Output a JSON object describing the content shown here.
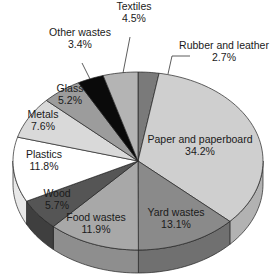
{
  "chart_data": {
    "type": "pie",
    "style": "3d-tilted",
    "title": "",
    "start_angle_deg": 0,
    "direction": "clockwise",
    "slices": [
      {
        "label": "Rubber and leather",
        "value": 2.7,
        "display": "2.7%",
        "color": "#7a7a7a",
        "side": "#5e5e5e"
      },
      {
        "label": "Paper and paperboard",
        "value": 34.2,
        "display": "34.2%",
        "color": "#cfcfcf",
        "side": "#b2b2b2"
      },
      {
        "label": "Yard wastes",
        "value": 13.1,
        "display": "13.1%",
        "color": "#8a8a8a",
        "side": "#707070"
      },
      {
        "label": "Food wastes",
        "value": 11.9,
        "display": "11.9%",
        "color": "#a8a8a8",
        "side": "#8e8e8e"
      },
      {
        "label": "Wood",
        "value": 5.7,
        "display": "5.7%",
        "color": "#555555",
        "side": "#3f3f3f"
      },
      {
        "label": "Plastics",
        "value": 11.8,
        "display": "11.8%",
        "color": "#ffffff",
        "side": "#e8e8e8"
      },
      {
        "label": "Metals",
        "value": 7.6,
        "display": "7.6%",
        "color": "#d9d9d9",
        "side": "#c2c2c2"
      },
      {
        "label": "Glass",
        "value": 5.2,
        "display": "5.2%",
        "color": "#9c9c9c",
        "side": "#828282"
      },
      {
        "label": "Other wastes",
        "value": 3.4,
        "display": "3.4%",
        "color": "#0a0a0a",
        "side": "#000000"
      },
      {
        "label": "Textiles",
        "value": 4.5,
        "display": "4.5%",
        "color": "#b4b4b4",
        "side": "#9a9a9a"
      }
    ],
    "labels": [
      {
        "name": "Rubber and leather",
        "pct": "2.7%",
        "x": 224,
        "y": 51,
        "leader": [
          [
            190,
            56
          ],
          [
            172,
            56
          ],
          [
            168,
            74
          ]
        ]
      },
      {
        "name": "Paper and paperboard",
        "pct": "34.2%",
        "x": 200,
        "y": 145
      },
      {
        "name": "Yard wastes",
        "pct": "13.1%",
        "x": 176,
        "y": 218
      },
      {
        "name": "Food wastes",
        "pct": "11.9%",
        "x": 96,
        "y": 223
      },
      {
        "name": "Wood",
        "pct": "5.7%",
        "x": 57,
        "y": 199
      },
      {
        "name": "Plastics",
        "pct": "11.8%",
        "x": 44,
        "y": 160
      },
      {
        "name": "Metals",
        "pct": "7.6%",
        "x": 43,
        "y": 120
      },
      {
        "name": "Glass",
        "pct": "5.2%",
        "x": 70,
        "y": 94
      },
      {
        "name": "Other wastes",
        "pct": "3.4%",
        "x": 80,
        "y": 38,
        "leader": [
          [
            82,
            63
          ],
          [
            90,
            79
          ]
        ]
      },
      {
        "name": "Textiles",
        "pct": "4.5%",
        "x": 134,
        "y": 12,
        "leader": [
          [
            130,
            37
          ],
          [
            123,
            73
          ]
        ]
      }
    ],
    "geometry": {
      "cx": 138,
      "cy": 161,
      "rx": 125,
      "ry": 89,
      "depth": 23
    }
  }
}
